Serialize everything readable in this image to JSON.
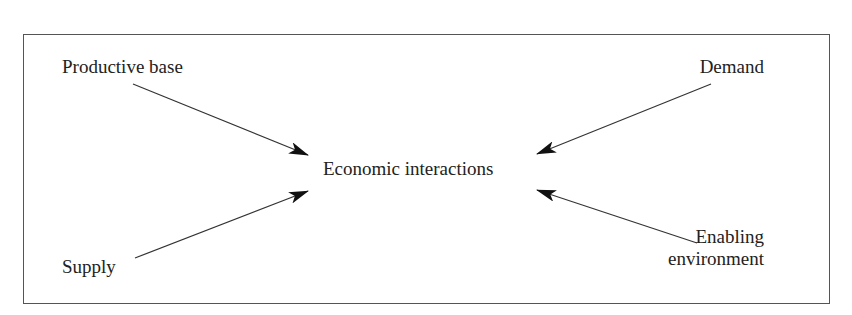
{
  "diagram": {
    "type": "flow",
    "center": {
      "label": "Economic interactions"
    },
    "inputs": [
      {
        "label": "Productive base",
        "position": "top-left"
      },
      {
        "label": "Demand",
        "position": "top-right"
      },
      {
        "label": "Supply",
        "position": "bottom-left"
      },
      {
        "label_line1": "Enabling",
        "label_line2": "environment",
        "position": "bottom-right"
      }
    ],
    "edges": [
      {
        "from": "Productive base",
        "to": "Economic interactions"
      },
      {
        "from": "Demand",
        "to": "Economic interactions"
      },
      {
        "from": "Supply",
        "to": "Economic interactions"
      },
      {
        "from": "Enabling environment",
        "to": "Economic interactions"
      }
    ]
  }
}
